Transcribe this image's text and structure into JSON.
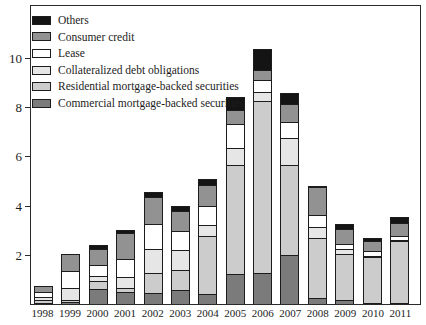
{
  "figure": {
    "background": "#ffffff",
    "border_color": "#2a2a2a"
  },
  "y_axis": {
    "tick_values": [
      2,
      4,
      6,
      8,
      10
    ],
    "px_per_unit": 24.6
  },
  "chart_data": {
    "type": "bar",
    "stacked": true,
    "title": "",
    "xlabel": "",
    "ylabel": "",
    "ylim": [
      0,
      12.15
    ],
    "grid": false,
    "legend_position": "top-left-inside",
    "categories": [
      "1998",
      "1999",
      "2000",
      "2001",
      "2002",
      "2003",
      "2004",
      "2005",
      "2006",
      "2007",
      "2008",
      "2009",
      "2010",
      "2011"
    ],
    "series": [
      {
        "name": "Commercial mortgage-backed securities",
        "color": "#7b7b7b",
        "values": [
          0.05,
          0.1,
          0.6,
          0.5,
          0.45,
          0.55,
          0.4,
          1.2,
          1.25,
          2.0,
          0.25,
          0.15,
          0.05,
          0.05
        ]
      },
      {
        "name": "Residential mortgage-backed securities",
        "color": "#cccccc",
        "values": [
          0.1,
          0.05,
          0.35,
          0.15,
          0.8,
          0.85,
          2.35,
          4.45,
          7.0,
          3.65,
          2.45,
          1.9,
          1.85,
          2.5
        ]
      },
      {
        "name": "Collateralized debt obligations",
        "color": "#e6e6e6",
        "values": [
          0.15,
          0.5,
          0.2,
          0.45,
          1.0,
          0.8,
          0.45,
          0.7,
          0.35,
          1.1,
          0.45,
          0.2,
          0.05,
          0.05
        ]
      },
      {
        "name": "Lease",
        "color": "#ffffff",
        "values": [
          0.2,
          0.7,
          0.45,
          0.75,
          1.0,
          0.75,
          0.8,
          0.95,
          0.5,
          0.65,
          0.45,
          0.2,
          0.2,
          0.15
        ]
      },
      {
        "name": "Consumer credit",
        "color": "#929292",
        "values": [
          0.25,
          0.7,
          0.65,
          1.05,
          1.1,
          0.85,
          0.85,
          0.6,
          0.4,
          0.75,
          1.15,
          0.6,
          0.4,
          0.55
        ]
      },
      {
        "name": "Others",
        "color": "#141414",
        "values": [
          0.0,
          0.0,
          0.15,
          0.1,
          0.2,
          0.2,
          0.25,
          0.5,
          0.85,
          0.45,
          0.05,
          0.2,
          0.15,
          0.25
        ]
      }
    ]
  }
}
